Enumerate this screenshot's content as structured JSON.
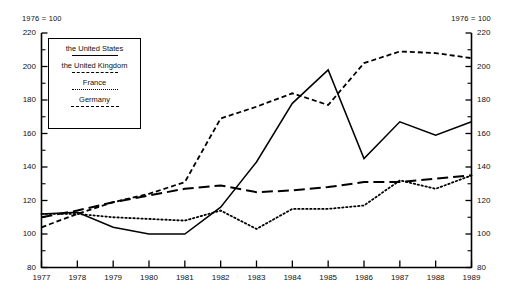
{
  "chart_data": {
    "type": "line",
    "title": "",
    "note_left": "1976 = 100",
    "note_right": "1976 = 100",
    "xlabel": "",
    "ylabel": "",
    "categories": [
      "1977",
      "1978",
      "1979",
      "1980",
      "1981",
      "1982",
      "1983",
      "1984",
      "1985",
      "1986",
      "1987",
      "1988",
      "1989"
    ],
    "x": [
      1977,
      1978,
      1979,
      1980,
      1981,
      1982,
      1983,
      1984,
      1985,
      1986,
      1987,
      1988,
      1989
    ],
    "ylim": [
      80,
      220
    ],
    "yticks": [
      80,
      100,
      120,
      140,
      160,
      180,
      200,
      220
    ],
    "ytick_labels": [
      "80",
      "100",
      "120",
      "140",
      "160",
      "180",
      "200",
      "220"
    ],
    "minor_yticks": [
      90,
      110,
      130,
      150,
      170,
      190,
      210
    ],
    "grid": false,
    "legend_position": "upper-left-inside",
    "series": [
      {
        "name": "the United States",
        "style": "solid",
        "values": [
          112,
          113,
          104,
          100,
          100,
          116,
          143,
          178,
          198,
          145,
          167,
          159,
          167
        ]
      },
      {
        "name": "the United Kingdom",
        "style": "dashed",
        "values": [
          104,
          112,
          119,
          124,
          131,
          169,
          176,
          184,
          177,
          202,
          209,
          208,
          205
        ]
      },
      {
        "name": "France",
        "style": "dotted",
        "values": [
          112,
          112,
          110,
          109,
          108,
          114,
          103,
          115,
          115,
          117,
          132,
          127,
          135
        ]
      },
      {
        "name": "Germany",
        "style": "long-dashed",
        "values": [
          110,
          114,
          119,
          123,
          127,
          129,
          125,
          126,
          128,
          131,
          131,
          133,
          135
        ]
      }
    ]
  },
  "legend": {
    "items": [
      {
        "label": "the United States",
        "swatch": "solid-line-swatch"
      },
      {
        "label": "the United Kingdom",
        "swatch": "dashed-line-swatch"
      },
      {
        "label": "France",
        "swatch": "dotted-line-swatch"
      },
      {
        "label": "Germany",
        "swatch": "long-dashed-line-swatch"
      }
    ]
  }
}
